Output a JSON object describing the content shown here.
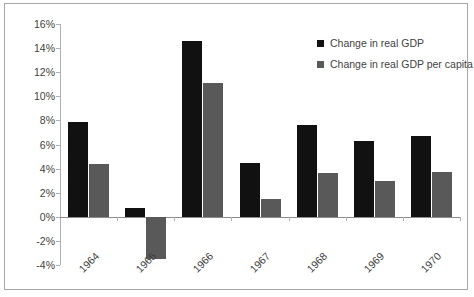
{
  "chart_data": {
    "type": "bar",
    "title": "",
    "xlabel": "",
    "ylabel": "",
    "categories": [
      "1964",
      "1965",
      "1966",
      "1967",
      "1968",
      "1969",
      "1970"
    ],
    "series": [
      {
        "name": "Change in real GDP",
        "color": "#111111",
        "values": [
          7.9,
          0.7,
          14.6,
          4.5,
          7.6,
          6.3,
          6.7
        ]
      },
      {
        "name": "Change in real GDP per capita",
        "color": "#595959",
        "values": [
          4.4,
          -3.5,
          11.1,
          1.5,
          3.6,
          3.0,
          3.7
        ]
      }
    ],
    "ylim": [
      -4,
      16
    ],
    "ytick_values": [
      16,
      14,
      12,
      10,
      8,
      6,
      4,
      2,
      0,
      -2,
      -4
    ],
    "ytick_labels": [
      "16%",
      "14%",
      "12%",
      "10%",
      "8%",
      "6%",
      "4%",
      "2%",
      "0%",
      "-2%",
      "-4%"
    ],
    "grid": false,
    "legend_position": "top-right",
    "value_suffix": "%"
  },
  "legend": {
    "items": [
      {
        "label": "Change in real GDP",
        "swatch": "black"
      },
      {
        "label": "Change in real GDP per capita",
        "swatch": "gray"
      }
    ]
  }
}
